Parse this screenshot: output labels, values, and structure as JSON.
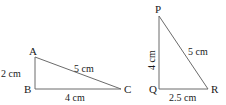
{
  "diagram": {
    "type": "geometry",
    "triangles": [
      {
        "name": "ABC",
        "vertices": {
          "A": {
            "label": "A",
            "x": 35,
            "y": 57
          },
          "B": {
            "label": "B",
            "x": 35,
            "y": 89
          },
          "C": {
            "label": "C",
            "x": 121,
            "y": 89
          }
        },
        "sides": {
          "AB": "2 cm",
          "BC": "4 cm",
          "AC": "5 cm"
        },
        "right_angle_at": "B"
      },
      {
        "name": "PQR",
        "vertices": {
          "P": {
            "label": "P",
            "x": 159,
            "y": 16
          },
          "Q": {
            "label": "Q",
            "x": 159,
            "y": 89
          },
          "R": {
            "label": "R",
            "x": 208,
            "y": 89
          }
        },
        "sides": {
          "PQ": "4 cm",
          "QR": "2.5 cm",
          "PR": "5 cm"
        },
        "right_angle_at": "Q"
      }
    ],
    "colors": {
      "line": "#6b6b6b",
      "text": "#1a1a1a"
    }
  }
}
